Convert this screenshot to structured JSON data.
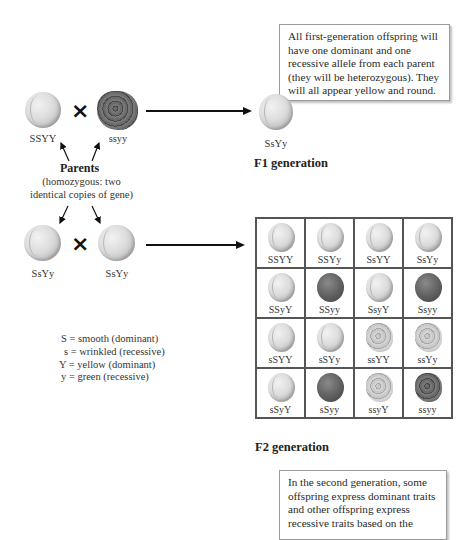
{
  "callouts": {
    "f1": "All first-generation offspring will have one dominant and one recessive allele from each parent (they will be heterozygous). They will all appear yellow and round.",
    "f2": "In the second generation, some offspring express dominant traits and other offspring express recessive traits based on the"
  },
  "parents": {
    "left": {
      "genotype": "SSYY",
      "phenotype": "yellow-round"
    },
    "right": {
      "genotype": "ssyy",
      "phenotype": "green-wrinkled"
    },
    "title": "Parents",
    "description": "(homozygous: two identical copies of gene)",
    "cross_symbol": "×"
  },
  "f1": {
    "offspring": {
      "genotype": "SsYy",
      "phenotype": "yellow-round"
    },
    "heading": "F1 generation"
  },
  "f1_cross": {
    "left": {
      "genotype": "SsYy",
      "phenotype": "yellow-round"
    },
    "right": {
      "genotype": "SsYy",
      "phenotype": "yellow-round"
    },
    "cross_symbol": "×"
  },
  "key": [
    "S = smooth (dominant)",
    "s = wrinkled (recessive)",
    "Y = yellow (dominant)",
    "y = green (recessive)"
  ],
  "punnett": {
    "rows": [
      [
        {
          "g": "SSYY",
          "p": "yellow-round"
        },
        {
          "g": "SSYy",
          "p": "yellow-round"
        },
        {
          "g": "SsYY",
          "p": "yellow-round"
        },
        {
          "g": "SsYy",
          "p": "yellow-round"
        }
      ],
      [
        {
          "g": "SSyY",
          "p": "yellow-round"
        },
        {
          "g": "SSyy",
          "p": "green-round"
        },
        {
          "g": "SsyY",
          "p": "yellow-round"
        },
        {
          "g": "Ssyy",
          "p": "green-round"
        }
      ],
      [
        {
          "g": "sSYY",
          "p": "yellow-round"
        },
        {
          "g": "sSYy",
          "p": "yellow-round"
        },
        {
          "g": "ssYY",
          "p": "yellow-wrinkled"
        },
        {
          "g": "ssYy",
          "p": "yellow-wrinkled"
        }
      ],
      [
        {
          "g": "sSyY",
          "p": "yellow-round"
        },
        {
          "g": "sSyy",
          "p": "green-round"
        },
        {
          "g": "ssyY",
          "p": "yellow-wrinkled"
        },
        {
          "g": "ssyy",
          "p": "green-wrinkled"
        }
      ]
    ]
  },
  "f2": {
    "heading": "F2 generation"
  }
}
